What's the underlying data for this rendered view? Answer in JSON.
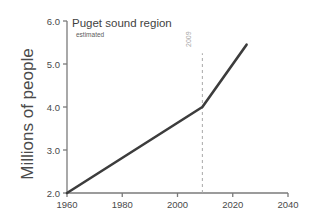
{
  "chart_data": {
    "type": "line",
    "title": "Puget sound region",
    "subtitle": "estimated",
    "xlabel": "",
    "ylabel": "Millions of people",
    "xlim": [
      1960,
      2040
    ],
    "ylim": [
      2.0,
      6.0
    ],
    "xticks": [
      "1960",
      "1980",
      "2000",
      "2020",
      "2040"
    ],
    "xtick_values": [
      1960,
      1980,
      2000,
      2020,
      2040
    ],
    "yticks": [
      "2.0",
      "3.0",
      "4.0",
      "5.0",
      "6.0"
    ],
    "ytick_values": [
      2.0,
      3.0,
      4.0,
      5.0,
      6.0
    ],
    "grid": false,
    "legend": false,
    "series": [
      {
        "name": "Puget sound region population",
        "x": [
          1960,
          2009,
          2025
        ],
        "values": [
          2.0,
          4.0,
          5.45
        ]
      }
    ],
    "annotations": [
      {
        "type": "vertical-dashed-line",
        "label": "2009",
        "x": 2009,
        "y_from": 2.0,
        "y_to": 5.25,
        "color": "#a8a8a8"
      }
    ],
    "colors": {
      "line": "#3c3c3c",
      "axis": "#7a7a7a",
      "text": "#4a4a4a",
      "annotation": "#a8a8a8",
      "background": "#ffffff"
    }
  }
}
